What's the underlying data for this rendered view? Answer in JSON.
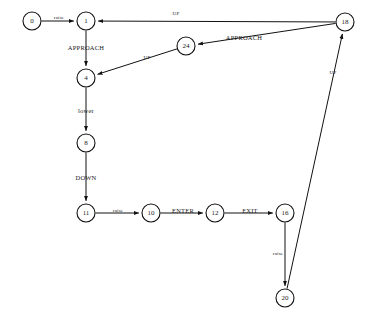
{
  "diagram": {
    "type": "state-transition-diagram",
    "title": "",
    "background_color": "#ffffff",
    "stroke_color": "#111111",
    "width": 368,
    "height": 327,
    "nodes": [
      {
        "id": "n0",
        "label": "0",
        "cx": 32,
        "cy": 21,
        "r": 9
      },
      {
        "id": "n1",
        "label": "1",
        "cx": 86,
        "cy": 21,
        "r": 9
      },
      {
        "id": "n18",
        "label": "18",
        "cx": 345,
        "cy": 22,
        "r": 9
      },
      {
        "id": "n24",
        "label": "24",
        "cx": 186,
        "cy": 46,
        "r": 9
      },
      {
        "id": "n4",
        "label": "4",
        "cx": 86,
        "cy": 78,
        "r": 9
      },
      {
        "id": "n8",
        "label": "8",
        "cx": 86,
        "cy": 143,
        "r": 9
      },
      {
        "id": "n11",
        "label": "11",
        "cx": 86,
        "cy": 213,
        "r": 9
      },
      {
        "id": "n10",
        "label": "10",
        "cx": 151,
        "cy": 213,
        "r": 9
      },
      {
        "id": "n12",
        "label": "12",
        "cx": 215,
        "cy": 213,
        "r": 9
      },
      {
        "id": "n16",
        "label": "16",
        "cx": 285,
        "cy": 213,
        "r": 9
      },
      {
        "id": "n20",
        "label": "20",
        "cx": 285,
        "cy": 298,
        "r": 9
      }
    ],
    "edges": [
      {
        "id": "e0",
        "from": "n0",
        "to": "n1",
        "label": "raise",
        "label_x": 59,
        "label_y": 17,
        "size": "small"
      },
      {
        "id": "e1",
        "from": "n18",
        "to": "n1",
        "label": "UP",
        "label_x": 176,
        "label_y": 13,
        "size": "small"
      },
      {
        "id": "e2",
        "from": "n1",
        "to": "n4",
        "label": "APPROACH",
        "label_x": 86,
        "label_y": 47,
        "size": "normal"
      },
      {
        "id": "e3",
        "from": "n18",
        "to": "n24",
        "label": "APPROACH",
        "label_x": 244,
        "label_y": 37,
        "size": "normal"
      },
      {
        "id": "e4",
        "from": "n24",
        "to": "n4",
        "label": "UP",
        "label_x": 147,
        "label_y": 57,
        "size": "small"
      },
      {
        "id": "e5",
        "from": "n4",
        "to": "n8",
        "label": "lower",
        "label_x": 86,
        "label_y": 110,
        "size": "normal"
      },
      {
        "id": "e6",
        "from": "n8",
        "to": "n11",
        "label": "DOWN",
        "label_x": 86,
        "label_y": 177,
        "size": "normal"
      },
      {
        "id": "e7",
        "from": "n11",
        "to": "n10",
        "label": "raise",
        "label_x": 118,
        "label_y": 210,
        "size": "small"
      },
      {
        "id": "e8",
        "from": "n10",
        "to": "n12",
        "label": "ENTER",
        "label_x": 183,
        "label_y": 210,
        "size": "normal"
      },
      {
        "id": "e9",
        "from": "n12",
        "to": "n16",
        "label": "EXIT",
        "label_x": 250,
        "label_y": 210,
        "size": "normal"
      },
      {
        "id": "e10",
        "from": "n16",
        "to": "n20",
        "label": "raise",
        "label_x": 278,
        "label_y": 253,
        "size": "small"
      },
      {
        "id": "e11",
        "from": "n20",
        "to": "n18",
        "label": "UP",
        "label_x": 333,
        "label_y": 72,
        "size": "small"
      }
    ]
  }
}
